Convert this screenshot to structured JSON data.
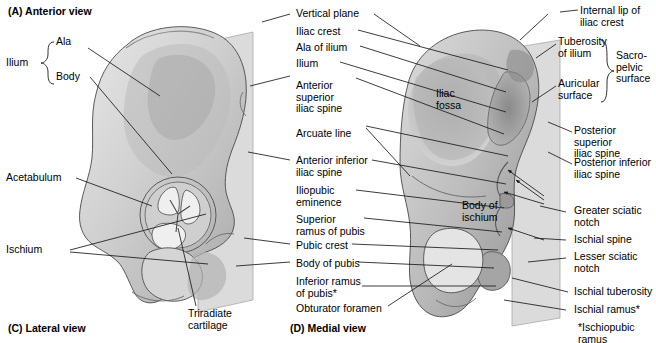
{
  "figure": {
    "panels": [
      {
        "id": "A",
        "caption": "(A) Anterior view"
      },
      {
        "id": "C",
        "caption": "(C) Lateral view"
      },
      {
        "id": "D",
        "caption": "(D) Medial view"
      }
    ],
    "footnote": "*Ischiopubic ramus"
  },
  "left_labels": {
    "ilium_group": "Ilium",
    "ala": "Ala",
    "body": "Body",
    "acetabulum": "Acetabulum",
    "ischium": "Ischium"
  },
  "center_labels": [
    {
      "text": "Vertical plane"
    },
    {
      "text": "Iliac crest"
    },
    {
      "text": "Ala of ilium"
    },
    {
      "text": "Ilium"
    },
    {
      "text": "Anterior\nsuperior\niliac spine"
    },
    {
      "text": "Arcuate line"
    },
    {
      "text": "Anterior inferior\niliac spine"
    },
    {
      "text": "Iliopubic\neminence"
    },
    {
      "text": "Superior\nramus of pubis"
    },
    {
      "text": "Pubic crest"
    },
    {
      "text": "Body of pubis"
    },
    {
      "text": "Inferior ramus\nof pubis*"
    },
    {
      "text": "Obturator foramen"
    }
  ],
  "right_labels": [
    {
      "text": "Internal lip of\niliac crest"
    },
    {
      "text": "Tuberosity\nof ilium"
    },
    {
      "text": "Auricular\nsurface"
    },
    {
      "text": "Sacro-\npelvic\nsurface"
    },
    {
      "text": "Posterior superior\niliac spine"
    },
    {
      "text": "Posterior inferior\niliac spine"
    },
    {
      "text": "Greater sciatic\nnotch"
    },
    {
      "text": "Ischial spine"
    },
    {
      "text": "Lesser sciatic\nnotch"
    },
    {
      "text": "Ischial tuberosity"
    },
    {
      "text": "Ischial ramus*"
    }
  ],
  "bone_labels": [
    {
      "text": "Iliac\nfossa"
    },
    {
      "text": "Body of\nischium"
    },
    {
      "text": "Triradiate\ncartilage"
    }
  ],
  "colors": {
    "background": "#ffffff",
    "text": "#000000",
    "leader": "#1a1a1a",
    "plane_fill": "#d9d9d9",
    "bone_outline": "#4a4a4a"
  }
}
